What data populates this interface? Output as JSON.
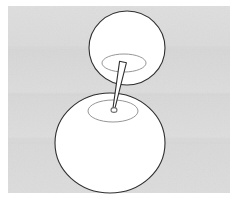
{
  "scene": {
    "title": "Two connected spheres with pin",
    "type": "line-drawing-illustration",
    "canvas": {
      "width": 238,
      "height": 201
    },
    "background": {
      "color": "#dcdcdc",
      "texture": "subtle-horizontal-banding-noise",
      "band_color": "#d4d4d4"
    },
    "frame": {
      "color": "#ffffff",
      "inset_left": 8,
      "inset_top": 6,
      "inset_right": 8,
      "inset_bottom": 8
    },
    "stroke": {
      "outline_color": "#2f2f2f",
      "outline_width": 1.1,
      "ellipse_color": "#8a8a8a",
      "ellipse_width": 0.9,
      "fill_color": "#ffffff"
    },
    "objects": [
      {
        "name": "upper-sphere",
        "shape": "ellipse",
        "cx": 127,
        "cy": 48,
        "rx": 38,
        "ry": 37,
        "fill": "#ffffff",
        "stroke": "#2f2f2f"
      },
      {
        "name": "upper-sphere-socket-ellipse",
        "shape": "ellipse",
        "cx": 124,
        "cy": 63,
        "rx": 22,
        "ry": 9,
        "fill": "none",
        "stroke": "#8a8a8a"
      },
      {
        "name": "lower-sphere",
        "shape": "ellipse",
        "cx": 110,
        "cy": 143,
        "rx": 55,
        "ry": 50,
        "fill": "#ffffff",
        "stroke": "#2f2f2f"
      },
      {
        "name": "lower-sphere-socket-ellipse",
        "shape": "ellipse",
        "cx": 113,
        "cy": 111,
        "rx": 25,
        "ry": 11,
        "fill": "none",
        "stroke": "#8a8a8a"
      },
      {
        "name": "connecting-pin",
        "shape": "tapered-shaft",
        "top_x": 123,
        "top_y": 62,
        "top_width": 7,
        "tip_x": 114,
        "tip_y": 108,
        "tip_width": 2,
        "fill": "#ffffff",
        "stroke": "#2f2f2f"
      },
      {
        "name": "pin-entry-hole",
        "shape": "small-ellipse",
        "cx": 114,
        "cy": 110,
        "rx": 3,
        "ry": 2.4,
        "fill": "#ffffff",
        "stroke": "#6f6f6f"
      }
    ]
  }
}
